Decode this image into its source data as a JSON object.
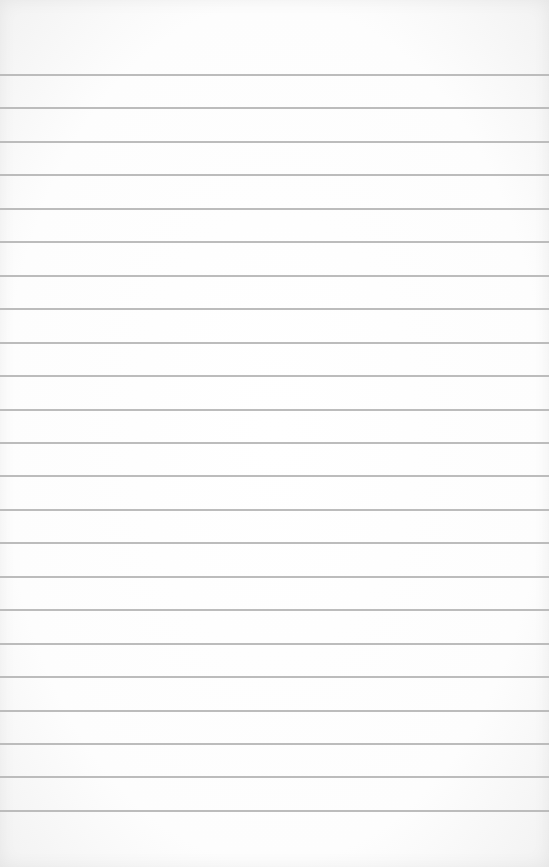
{
  "document": {
    "type": "lined-paper",
    "background_color": "#fdfdfd",
    "rule_color": "#b8b8b8",
    "rules": {
      "count": 23,
      "first_y": 75,
      "spacing": 33.45,
      "thickness": 2
    },
    "text": ""
  }
}
